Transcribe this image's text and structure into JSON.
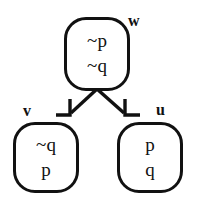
{
  "diagram": {
    "type": "kripke-accessibility-model",
    "background_color": "#ffffff",
    "stroke_color": "#111111",
    "nodes": [
      {
        "id": "w",
        "label": "w",
        "position": "top-center",
        "propositions": [
          "~p",
          "~q"
        ]
      },
      {
        "id": "v",
        "label": "v",
        "position": "bottom-left",
        "propositions": [
          "~q",
          "p"
        ]
      },
      {
        "id": "u",
        "label": "u",
        "position": "bottom-right",
        "propositions": [
          "p",
          "q"
        ]
      }
    ],
    "edges": [
      {
        "from": "w",
        "to": "v",
        "style": "arrow",
        "direction": "down-left"
      },
      {
        "from": "w",
        "to": "u",
        "style": "arrow",
        "direction": "down-right"
      }
    ]
  }
}
